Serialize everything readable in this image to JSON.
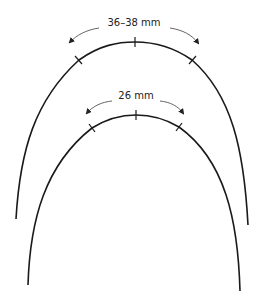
{
  "diagram": {
    "type": "dental-arch-comparison",
    "colors": {
      "arch": "#1a1a1a",
      "arrow": "#555555",
      "background": "#ffffff"
    },
    "arches": [
      {
        "id": "outer",
        "measurement_label": "36–38 mm",
        "label_position": [
          134,
          17
        ],
        "apex": [
          135,
          42
        ],
        "ticks": [
          [
            79,
            60
          ],
          [
            135,
            42
          ],
          [
            192,
            60
          ]
        ],
        "ends": [
          [
            16,
            219
          ],
          [
            248,
            225
          ]
        ]
      },
      {
        "id": "inner",
        "measurement_label": "26 mm",
        "label_position": [
          136,
          90
        ],
        "apex": [
          136,
          115
        ],
        "ticks": [
          [
            92,
            128
          ],
          [
            136,
            115
          ],
          [
            179,
            127
          ]
        ],
        "ends": [
          [
            28,
            285
          ],
          [
            240,
            291
          ]
        ]
      }
    ]
  }
}
